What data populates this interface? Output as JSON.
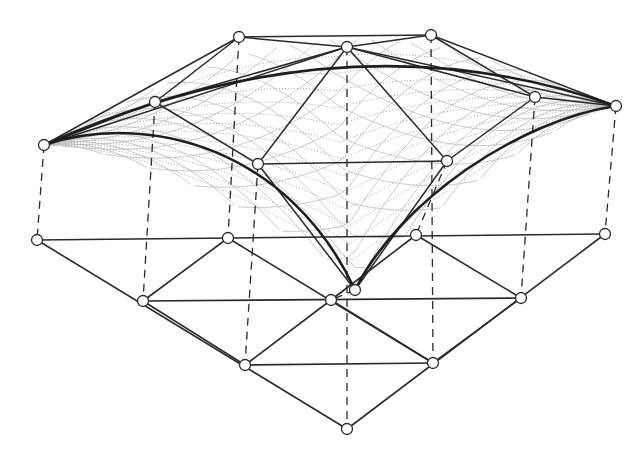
{
  "figure": {
    "colors": {
      "line": "#2a2a2a",
      "edge": "#1e1e1e",
      "mesh_dotted": "#9a9a9a",
      "mesh_diagonal": "#bdbdbd",
      "node_fill": "#ffffff",
      "background": "#ffffff"
    }
  },
  "upper_nodes": {
    "T1": [
      239,
      37
    ],
    "T2": [
      347,
      47
    ],
    "T3": [
      431,
      35
    ],
    "L": [
      44,
      145
    ],
    "R": [
      616,
      106
    ],
    "ML": [
      155,
      102
    ],
    "MR": [
      535,
      97
    ],
    "CL": [
      258,
      164
    ],
    "CR": [
      447,
      161
    ],
    "B": [
      355,
      290
    ]
  },
  "ground_nodes": {
    "G1": [
      37,
      240
    ],
    "G2": [
      228,
      238
    ],
    "G3": [
      416,
      235
    ],
    "G4": [
      605,
      234
    ],
    "G5": [
      143,
      301
    ],
    "G6": [
      331,
      300
    ],
    "G7": [
      521,
      298
    ],
    "G8": [
      245,
      365
    ],
    "G9": [
      433,
      363
    ],
    "G10": [
      347,
      429
    ]
  },
  "upper_struts": [
    [
      "L",
      "T1"
    ],
    [
      "T1",
      "T3"
    ],
    [
      "T3",
      "R"
    ],
    [
      "T1",
      "T2"
    ],
    [
      "T2",
      "T3"
    ],
    [
      "L",
      "ML"
    ],
    [
      "ML",
      "T1"
    ],
    [
      "T3",
      "MR"
    ],
    [
      "MR",
      "R"
    ],
    [
      "T2",
      "ML"
    ],
    [
      "T2",
      "MR"
    ],
    [
      "ML",
      "CL"
    ],
    [
      "MR",
      "CR"
    ],
    [
      "T2",
      "CL"
    ],
    [
      "T2",
      "CR"
    ],
    [
      "CL",
      "CR"
    ],
    [
      "CL",
      "B"
    ],
    [
      "CR",
      "B"
    ],
    [
      "L",
      "T2"
    ],
    [
      "T2",
      "R"
    ]
  ],
  "edge_curves": [
    "M 44 145 Q 347 10 616 106",
    "M 44 145 C 150 110 290 150 355 290",
    "M 616 106 C 520 120 400 200 355 290"
  ],
  "dashed_verticals": [
    [
      "L",
      "G1"
    ],
    [
      "ML",
      "G5"
    ],
    [
      "T1",
      "G2"
    ],
    [
      "T2",
      "G10"
    ],
    [
      "T3",
      "G9"
    ],
    [
      "MR",
      "G7"
    ],
    [
      "R",
      "G4"
    ],
    [
      "CL",
      "G8"
    ],
    [
      "CR",
      "G3"
    ],
    [
      "B",
      "G6"
    ]
  ],
  "ground_edges": [
    [
      "G1",
      "G4"
    ],
    [
      "G5",
      "G7"
    ],
    [
      "G8",
      "G9"
    ],
    [
      "G1",
      "G10"
    ],
    [
      "G2",
      "G5"
    ],
    [
      "G2",
      "G9"
    ],
    [
      "G3",
      "G6"
    ],
    [
      "G3",
      "G7"
    ],
    [
      "G4",
      "G10"
    ],
    [
      "G6",
      "G8"
    ],
    [
      "G6",
      "G9"
    ],
    [
      "G5",
      "G8"
    ],
    [
      "G7",
      "G9"
    ]
  ]
}
